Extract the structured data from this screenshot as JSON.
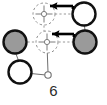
{
  "figure": {
    "caption": "6",
    "type": "node-link-diagram",
    "canvas": {
      "width": 107,
      "height": 105,
      "background": "#ffffff"
    },
    "colors": {
      "node_fill_filled": "#9a9a9a",
      "node_fill_empty": "#ffffff",
      "node_stroke": "#111111",
      "ghost_stroke": "#8d8d8d",
      "edge_stroke": "#6f6f6f",
      "arrow_stroke": "#000000",
      "caption_color": "#2b2b2b"
    },
    "nodes": [
      {
        "id": "n-top-right",
        "label": "",
        "state": "empty",
        "cx": 84,
        "cy": 14,
        "r": 11.5,
        "stroke_width": 2.4
      },
      {
        "id": "n-mid-left",
        "label": "",
        "state": "filled",
        "cx": 15,
        "cy": 42,
        "r": 11.5,
        "stroke_width": 2.4
      },
      {
        "id": "n-mid-right",
        "label": "",
        "state": "filled",
        "cx": 85,
        "cy": 42,
        "r": 11.5,
        "stroke_width": 2.4
      },
      {
        "id": "n-bottom-left",
        "label": "",
        "state": "empty",
        "cx": 20,
        "cy": 72,
        "r": 11.5,
        "stroke_width": 2.4
      },
      {
        "id": "n-small-hollow",
        "label": "",
        "state": "empty",
        "cx": 48,
        "cy": 75,
        "r": 3.2,
        "stroke_width": 1.1
      }
    ],
    "ghost_targets": [
      {
        "id": "ghost-top",
        "cx": 44,
        "cy": 14,
        "r": 11.0,
        "marker": "crosshair"
      },
      {
        "id": "ghost-middle",
        "cx": 47,
        "cy": 42,
        "r": 11.0,
        "marker": "crosshair"
      }
    ],
    "arrows": [
      {
        "id": "arrow-top",
        "x1": 73,
        "y1": 6,
        "x2": 47,
        "y2": 6,
        "direction": "left",
        "stroke_width": 2.6
      },
      {
        "id": "arrow-middle",
        "x1": 74,
        "y1": 34,
        "x2": 50,
        "y2": 34,
        "direction": "left",
        "stroke_width": 2.6
      }
    ],
    "edges": [
      {
        "id": "edge-ghosttop-right",
        "x1": 55,
        "y1": 14,
        "x2": 72,
        "y2": 14,
        "style": "dashed"
      },
      {
        "id": "edge-ghosttop-down",
        "x1": 44,
        "y1": 25,
        "x2": 44,
        "y2": 31,
        "style": "dashed"
      },
      {
        "id": "edge-midleft-ghost",
        "x1": 27,
        "y1": 42,
        "x2": 36,
        "y2": 42,
        "style": "dashed"
      },
      {
        "id": "edge-ghostmid-right",
        "x1": 58,
        "y1": 42,
        "x2": 73,
        "y2": 42,
        "style": "dashed"
      },
      {
        "id": "edge-topright-down",
        "x1": 84,
        "y1": 26,
        "x2": 85,
        "y2": 30,
        "style": "solid"
      },
      {
        "id": "edge-midleft-down",
        "x1": 16,
        "y1": 54,
        "x2": 18,
        "y2": 60,
        "style": "solid"
      },
      {
        "id": "edge-ghostmid-down",
        "x1": 47,
        "y1": 53,
        "x2": 48,
        "y2": 72,
        "style": "solid"
      },
      {
        "id": "edge-bottomleft-dot",
        "x1": 32,
        "y1": 74,
        "x2": 45,
        "y2": 75,
        "style": "solid"
      }
    ]
  }
}
